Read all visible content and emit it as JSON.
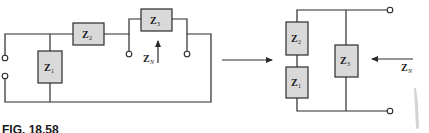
{
  "figure": {
    "caption": "FIG. 18.58"
  },
  "left_circuit": {
    "impedances": [
      {
        "id": "z1",
        "symbol": "Z",
        "subscript": "1"
      },
      {
        "id": "z2",
        "symbol": "Z",
        "subscript": "2"
      },
      {
        "id": "z3",
        "symbol": "Z",
        "subscript": "3"
      }
    ],
    "looking_in_label": {
      "symbol": "Z",
      "subscript": "N"
    }
  },
  "right_circuit": {
    "impedances": [
      {
        "id": "z2",
        "symbol": "Z",
        "subscript": "2"
      },
      {
        "id": "z1",
        "symbol": "Z",
        "subscript": "1"
      },
      {
        "id": "z3",
        "symbol": "Z",
        "subscript": "3"
      }
    ],
    "looking_in_label": {
      "symbol": "Z",
      "subscript": "N"
    }
  },
  "colors": {
    "line": "#2a2a2a",
    "component_fill": "#d9d9d9",
    "background": "#ffffff"
  }
}
